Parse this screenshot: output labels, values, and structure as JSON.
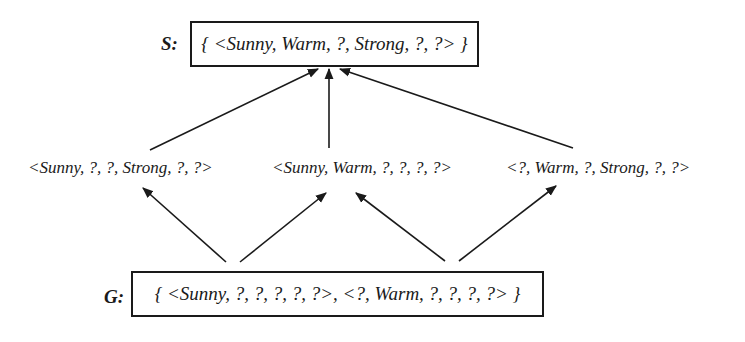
{
  "diagram": {
    "type": "version-space-lattice",
    "specific_boundary": {
      "label": "S:",
      "set_text": "{ <Sunny, Warm, ?, Strong, ?, ?> }",
      "members": [
        "<Sunny, Warm, ?, Strong, ?, ?>"
      ]
    },
    "intermediate_hypotheses": [
      {
        "id": "h1",
        "text": "<Sunny, ?, ?, Strong, ?, ?>"
      },
      {
        "id": "h2",
        "text": "<Sunny, Warm, ?, ?, ?, ?>"
      },
      {
        "id": "h3",
        "text": "<?, Warm, ?, Strong, ?, ?>"
      }
    ],
    "general_boundary": {
      "label": "G:",
      "set_text": "{ <Sunny, ?, ?, ?, ?, ?>, <?, Warm, ?, ?, ?, ?> }",
      "members": [
        "<Sunny, ?, ?, ?, ?, ?>",
        "<?, Warm, ?, ?, ?, ?>"
      ]
    },
    "edges": [
      {
        "from": "h1",
        "to": "S"
      },
      {
        "from": "h2",
        "to": "S"
      },
      {
        "from": "h3",
        "to": "S"
      },
      {
        "from": "G.0",
        "to": "h1"
      },
      {
        "from": "G.0",
        "to": "h2"
      },
      {
        "from": "G.1",
        "to": "h2"
      },
      {
        "from": "G.1",
        "to": "h3"
      }
    ],
    "colors": {
      "ink": "#1a1a1a",
      "background": "#ffffff"
    }
  }
}
